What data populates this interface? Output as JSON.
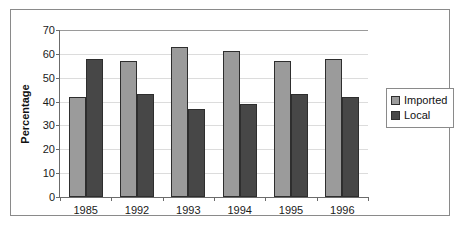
{
  "chart_data": {
    "type": "bar",
    "title": "",
    "xlabel": "",
    "ylabel": "Percentage",
    "ylim": [
      0,
      70
    ],
    "yticks": [
      0,
      10,
      20,
      30,
      40,
      50,
      60,
      70
    ],
    "grid": true,
    "legend_position": "right",
    "categories": [
      "1985",
      "1992",
      "1993",
      "1994",
      "1995",
      "1996"
    ],
    "series": [
      {
        "name": "Imported",
        "color": "#9b9b9b",
        "values": [
          42,
          57,
          63,
          61,
          57,
          58
        ]
      },
      {
        "name": "Local",
        "color": "#474747",
        "values": [
          58,
          43,
          37,
          39,
          43,
          42
        ]
      }
    ]
  },
  "legend": {
    "items": [
      {
        "label": "Imported",
        "swatch": "legend-swatch-imported"
      },
      {
        "label": "Local",
        "swatch": "legend-swatch-local"
      }
    ]
  },
  "colors": {
    "imported": "#9b9b9b",
    "local": "#474747",
    "axis": "#6b6b6b",
    "gridline": "#dcdcdc",
    "frame_border": "#8a8a8a",
    "bar_outline": "#2e2e2e",
    "text": "#1a1a1a"
  }
}
